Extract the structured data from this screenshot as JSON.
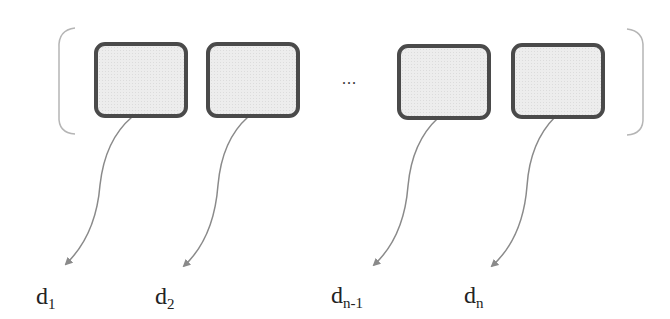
{
  "diagram": {
    "type": "vector-to-outputs",
    "boxes": [
      {
        "id": "box-1",
        "x": 94,
        "y": 42
      },
      {
        "id": "box-2",
        "x": 206,
        "y": 42
      },
      {
        "id": "box-n-1",
        "x": 397,
        "y": 44
      },
      {
        "id": "box-n",
        "x": 511,
        "y": 43
      }
    ],
    "ellipsis": "...",
    "labels": [
      {
        "base": "d",
        "sub": "1"
      },
      {
        "base": "d",
        "sub": "2"
      },
      {
        "base": "d",
        "sub": "n-1"
      },
      {
        "base": "d",
        "sub": "n"
      }
    ],
    "colors": {
      "box_border": "#4a4a4a",
      "box_fill": "#ededed",
      "arrow": "#8a8a8a",
      "bracket": "#b0b0b0",
      "text": "#222222"
    }
  }
}
